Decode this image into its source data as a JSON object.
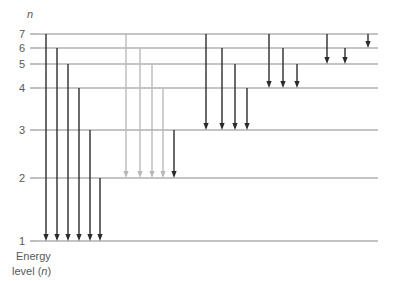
{
  "figure": {
    "axis_header": "n",
    "axis_caption_line1": "Energy",
    "axis_caption_line2_pre": "level (",
    "axis_caption_line2_var": "n",
    "axis_caption_line2_post": ")",
    "background_color": "#ffffff"
  },
  "chart_data": {
    "type": "diagram",
    "title": "",
    "xlabel": "",
    "ylabel": "Energy level (n)",
    "grid": false,
    "legend": "none",
    "axis_variable": "n",
    "level_label_color": "#55595c",
    "level_line_color": "#8a8a8a",
    "arrow_dark_color": "#2b2b2b",
    "arrow_light_color": "#b9b9b9",
    "levels": [
      {
        "label": "7",
        "n": 7,
        "y": 34
      },
      {
        "label": "6",
        "n": 6,
        "y": 48
      },
      {
        "label": "5",
        "n": 5,
        "y": 64
      },
      {
        "label": "4",
        "n": 4,
        "y": 88
      },
      {
        "label": "3",
        "n": 3,
        "y": 130
      },
      {
        "label": "2",
        "n": 2,
        "y": 178
      },
      {
        "label": "1",
        "n": 1,
        "y": 241
      }
    ],
    "level_line_x_start": 38,
    "level_line_x_end": 378,
    "series": [
      {
        "name": "Transitions to n=1 (Lyman series)",
        "final_level": 1,
        "color": "#2b2b2b",
        "transitions": [
          {
            "from": 7,
            "to": 1,
            "x": 46
          },
          {
            "from": 6,
            "to": 1,
            "x": 57
          },
          {
            "from": 5,
            "to": 1,
            "x": 68
          },
          {
            "from": 4,
            "to": 1,
            "x": 79
          },
          {
            "from": 3,
            "to": 1,
            "x": 90
          },
          {
            "from": 2,
            "to": 1,
            "x": 100
          }
        ]
      },
      {
        "name": "Transitions to n=2 (Balmer series)",
        "final_level": 2,
        "color": "#b9b9b9",
        "transitions": [
          {
            "from": 7,
            "to": 2,
            "x": 126
          },
          {
            "from": 6,
            "to": 2,
            "x": 140
          },
          {
            "from": 5,
            "to": 2,
            "x": 152
          },
          {
            "from": 4,
            "to": 2,
            "x": 163
          },
          {
            "from": 3,
            "to": 2,
            "x": 174,
            "color": "#2b2b2b"
          }
        ]
      },
      {
        "name": "Transitions to n=3 (Paschen series)",
        "final_level": 3,
        "color": "#2b2b2b",
        "transitions": [
          {
            "from": 7,
            "to": 3,
            "x": 206
          },
          {
            "from": 6,
            "to": 3,
            "x": 222
          },
          {
            "from": 5,
            "to": 3,
            "x": 235
          },
          {
            "from": 4,
            "to": 3,
            "x": 247
          }
        ]
      },
      {
        "name": "Transitions to n=4 (Brackett series)",
        "final_level": 4,
        "color": "#2b2b2b",
        "transitions": [
          {
            "from": 7,
            "to": 4,
            "x": 269
          },
          {
            "from": 6,
            "to": 4,
            "x": 283
          },
          {
            "from": 5,
            "to": 4,
            "x": 297
          }
        ]
      },
      {
        "name": "Transitions to n=5 (Pfund series)",
        "final_level": 5,
        "color": "#2b2b2b",
        "transitions": [
          {
            "from": 7,
            "to": 5,
            "x": 327
          },
          {
            "from": 6,
            "to": 5,
            "x": 345
          }
        ]
      },
      {
        "name": "Transitions to n=6 (Humphreys series)",
        "final_level": 6,
        "color": "#2b2b2b",
        "transitions": [
          {
            "from": 7,
            "to": 6,
            "x": 368
          }
        ]
      }
    ]
  }
}
